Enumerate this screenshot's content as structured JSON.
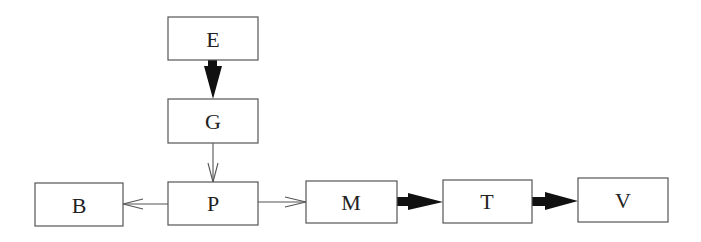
{
  "diagram": {
    "type": "flow-diagram",
    "nodes": [
      {
        "id": "E",
        "label": "E",
        "x": 168,
        "y": 17,
        "w": 90,
        "h": 43
      },
      {
        "id": "G",
        "label": "G",
        "x": 168,
        "y": 99,
        "w": 90,
        "h": 44
      },
      {
        "id": "B",
        "label": "B",
        "x": 35,
        "y": 183,
        "w": 88,
        "h": 43
      },
      {
        "id": "P",
        "label": "P",
        "x": 168,
        "y": 182,
        "w": 90,
        "h": 43
      },
      {
        "id": "M",
        "label": "M",
        "x": 306,
        "y": 181,
        "w": 91,
        "h": 42
      },
      {
        "id": "T",
        "label": "T",
        "x": 443,
        "y": 180,
        "w": 89,
        "h": 43
      },
      {
        "id": "V",
        "label": "V",
        "x": 578,
        "y": 178,
        "w": 90,
        "h": 44
      }
    ],
    "edges": [
      {
        "from": "E",
        "to": "G",
        "style": "thick"
      },
      {
        "from": "G",
        "to": "P",
        "style": "thin"
      },
      {
        "from": "P",
        "to": "B",
        "style": "thin"
      },
      {
        "from": "P",
        "to": "M",
        "style": "thin"
      },
      {
        "from": "M",
        "to": "T",
        "style": "thick"
      },
      {
        "from": "T",
        "to": "V",
        "style": "thick"
      }
    ],
    "colors": {
      "box_stroke": "#555555",
      "thick_arrow": "#111111",
      "background": "#ffffff"
    }
  }
}
